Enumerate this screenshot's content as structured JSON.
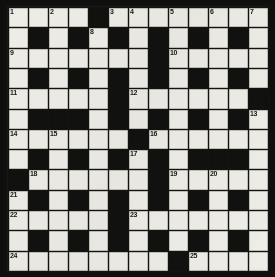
{
  "puzzle": {
    "title": "Crossword Grid",
    "type": "crossword",
    "columns": 13,
    "rows": 13,
    "colors": {
      "block": "#111110",
      "cell": "#eeede8",
      "grid_line": "#13130f",
      "number_text": "#18180f",
      "background": "#b9b9b3"
    },
    "legend": {
      "white_cell": "fillable-square",
      "black_cell": "block-square"
    },
    "grid": [
      [
        "W",
        "W",
        "W",
        "W",
        "B",
        "W",
        "W",
        "W",
        "W",
        "W",
        "W",
        "W",
        "W"
      ],
      [
        "W",
        "B",
        "W",
        "B",
        "W",
        "B",
        "W",
        "B",
        "W",
        "B",
        "W",
        "B",
        "W"
      ],
      [
        "W",
        "W",
        "W",
        "W",
        "W",
        "W",
        "W",
        "B",
        "W",
        "W",
        "W",
        "W",
        "W"
      ],
      [
        "W",
        "B",
        "W",
        "B",
        "W",
        "B",
        "W",
        "B",
        "W",
        "B",
        "W",
        "B",
        "W"
      ],
      [
        "W",
        "W",
        "W",
        "W",
        "W",
        "B",
        "W",
        "W",
        "W",
        "W",
        "W",
        "W",
        "B"
      ],
      [
        "W",
        "B",
        "B",
        "B",
        "W",
        "B",
        "W",
        "B",
        "W",
        "B",
        "W",
        "B",
        "W"
      ],
      [
        "W",
        "W",
        "W",
        "W",
        "W",
        "W",
        "B",
        "W",
        "W",
        "W",
        "W",
        "W",
        "W"
      ],
      [
        "W",
        "B",
        "W",
        "B",
        "W",
        "B",
        "W",
        "B",
        "W",
        "B",
        "B",
        "B",
        "W"
      ],
      [
        "B",
        "W",
        "W",
        "W",
        "W",
        "W",
        "W",
        "B",
        "W",
        "W",
        "W",
        "W",
        "W"
      ],
      [
        "W",
        "B",
        "W",
        "B",
        "W",
        "B",
        "W",
        "B",
        "W",
        "B",
        "W",
        "B",
        "W"
      ],
      [
        "W",
        "W",
        "W",
        "W",
        "W",
        "B",
        "W",
        "W",
        "W",
        "W",
        "W",
        "W",
        "W"
      ],
      [
        "W",
        "B",
        "W",
        "B",
        "W",
        "B",
        "W",
        "B",
        "W",
        "B",
        "W",
        "B",
        "W"
      ],
      [
        "W",
        "W",
        "W",
        "W",
        "W",
        "W",
        "W",
        "W",
        "B",
        "W",
        "W",
        "W",
        "W"
      ]
    ],
    "numbers": [
      {
        "n": 1,
        "row": 1,
        "col": 1
      },
      {
        "n": 2,
        "row": 1,
        "col": 3
      },
      {
        "n": 3,
        "row": 1,
        "col": 6
      },
      {
        "n": 4,
        "row": 1,
        "col": 7
      },
      {
        "n": 5,
        "row": 1,
        "col": 9
      },
      {
        "n": 6,
        "row": 1,
        "col": 11
      },
      {
        "n": 7,
        "row": 1,
        "col": 13
      },
      {
        "n": 8,
        "row": 2,
        "col": 5
      },
      {
        "n": 9,
        "row": 3,
        "col": 1
      },
      {
        "n": 10,
        "row": 3,
        "col": 9
      },
      {
        "n": 11,
        "row": 5,
        "col": 1
      },
      {
        "n": 12,
        "row": 5,
        "col": 7
      },
      {
        "n": 13,
        "row": 6,
        "col": 13
      },
      {
        "n": 14,
        "row": 7,
        "col": 1
      },
      {
        "n": 15,
        "row": 7,
        "col": 3
      },
      {
        "n": 16,
        "row": 7,
        "col": 8
      },
      {
        "n": 17,
        "row": 8,
        "col": 7
      },
      {
        "n": 18,
        "row": 9,
        "col": 2
      },
      {
        "n": 19,
        "row": 9,
        "col": 9
      },
      {
        "n": 20,
        "row": 9,
        "col": 11
      },
      {
        "n": 21,
        "row": 10,
        "col": 1
      },
      {
        "n": 22,
        "row": 11,
        "col": 1
      },
      {
        "n": 23,
        "row": 11,
        "col": 7
      },
      {
        "n": 24,
        "row": 13,
        "col": 1
      },
      {
        "n": 25,
        "row": 13,
        "col": 10
      }
    ]
  }
}
